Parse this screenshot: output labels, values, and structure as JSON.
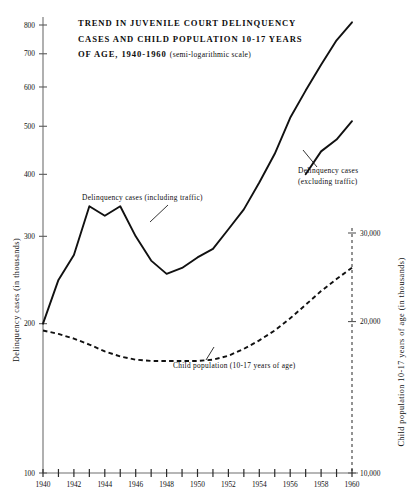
{
  "chart_data": {
    "type": "line",
    "title_lines": [
      "TREND IN JUVENILE COURT DELINQUENCY",
      "CASES AND CHILD POPULATION 10-17 YEARS",
      "OF AGE, 1940-1960"
    ],
    "title_suffix": "(semi-logarithmic scale)",
    "xlabel": "",
    "ylabel": "Delinquency cases (in thousands)",
    "y2label": "Child population 10-17 years of age (in thousands)",
    "scale": "semi-logarithmic",
    "grid": false,
    "legend": "annotations",
    "xlim": [
      1940,
      1960
    ],
    "ylim": [
      100,
      800
    ],
    "y2lim": [
      10000,
      30000
    ],
    "yticks": [
      100,
      200,
      300,
      400,
      500,
      600,
      700,
      800
    ],
    "yticklabels": [
      "100",
      "200",
      "300",
      "400",
      "500",
      "600",
      "700",
      "800"
    ],
    "y2ticks": [
      10000,
      20000,
      30000
    ],
    "y2ticklabels": [
      "10,000",
      "20,000",
      "30,000"
    ],
    "xticks": [
      1940,
      1941,
      1942,
      1943,
      1944,
      1945,
      1946,
      1947,
      1948,
      1949,
      1950,
      1951,
      1952,
      1953,
      1954,
      1955,
      1956,
      1957,
      1958,
      1959,
      1960
    ],
    "xticklabels": [
      "1940",
      "",
      "1942",
      "",
      "1944",
      "",
      "1946",
      "",
      "1948",
      "",
      "1950",
      "",
      "1952",
      "",
      "1954",
      "",
      "1956",
      "",
      "1958",
      "",
      "1960"
    ],
    "x": [
      1940,
      1941,
      1942,
      1943,
      1944,
      1945,
      1946,
      1947,
      1948,
      1949,
      1950,
      1951,
      1952,
      1953,
      1954,
      1955,
      1956,
      1957,
      1958,
      1959,
      1960
    ],
    "series": [
      {
        "name": "Delinquency cases (including traffic)",
        "style": "solid",
        "axis": "left",
        "values": [
          200,
          245,
          275,
          345,
          330,
          345,
          300,
          268,
          252,
          259,
          272,
          283,
          310,
          340,
          385,
          440,
          520,
          590,
          665,
          745,
          810
        ]
      },
      {
        "name": "Child population (10-17 years of age)",
        "style": "dashed",
        "axis": "right",
        "values": [
          19200,
          18900,
          18500,
          18000,
          17450,
          17050,
          16800,
          16700,
          16700,
          16700,
          16700,
          16800,
          17100,
          17650,
          18350,
          19200,
          20300,
          21600,
          23000,
          24300,
          25600
        ]
      },
      {
        "name": "Delinquency cases (excluding traffic)",
        "style": "solid",
        "axis": "left",
        "x": [
          1957,
          1958,
          1959,
          1960
        ],
        "values": [
          400,
          445,
          470,
          512
        ]
      }
    ],
    "annotations": [
      {
        "key": "including",
        "text_lines": [
          "Delinquency cases  (including traffic)"
        ]
      },
      {
        "key": "excluding",
        "text_lines": [
          "Delinquency cases",
          "(excluding traffic)"
        ]
      },
      {
        "key": "population",
        "text_lines": [
          "Child population  (10-17 years of age)"
        ]
      }
    ],
    "colors": {
      "line": "#111111",
      "axis": "#6f6f6f",
      "background": "#ffffff"
    }
  }
}
